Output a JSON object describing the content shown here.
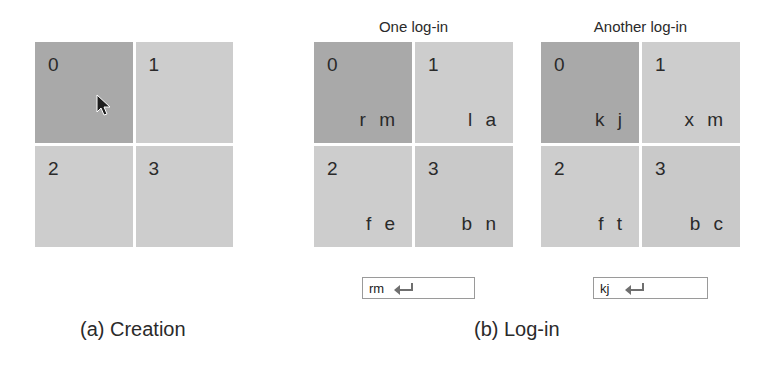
{
  "figure": {
    "panel_a": {
      "caption": "(a) Creation",
      "cells": [
        {
          "index": "0",
          "code": "",
          "selected": true
        },
        {
          "index": "1",
          "code": ""
        },
        {
          "index": "2",
          "code": ""
        },
        {
          "index": "3",
          "code": ""
        }
      ],
      "cursor_icon": "mouse-pointer-icon"
    },
    "panel_b": {
      "caption": "(b) Log-in",
      "logins": [
        {
          "title": "One log-in",
          "cells": [
            {
              "index": "0",
              "code": "r m",
              "selected": true
            },
            {
              "index": "1",
              "code": "l a"
            },
            {
              "index": "2",
              "code": "f e"
            },
            {
              "index": "3",
              "code": "b n"
            }
          ],
          "input_value": "rm",
          "input_icon": "enter-key-icon"
        },
        {
          "title": "Another log-in",
          "cells": [
            {
              "index": "0",
              "code": "k j",
              "selected": true
            },
            {
              "index": "1",
              "code": "x m"
            },
            {
              "index": "2",
              "code": "f t"
            },
            {
              "index": "3",
              "code": "b c"
            }
          ],
          "input_value": "kj",
          "input_icon": "enter-key-icon"
        }
      ]
    },
    "colors": {
      "selected_cell": "#a9a9a9",
      "cell": "#cdcdcd",
      "text": "#2a2a2a"
    }
  }
}
